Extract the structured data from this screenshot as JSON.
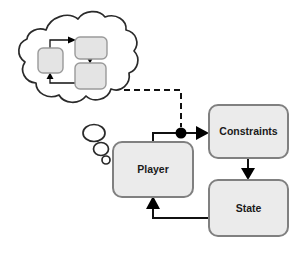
{
  "diagram": {
    "background_color": "#ffffff",
    "node_fill": "#ebebeb",
    "node_stroke": "#808080",
    "line_color": "#111111",
    "nodes": [
      {
        "id": "player",
        "label": "Player",
        "x": 113,
        "y": 142,
        "w": 80,
        "h": 55
      },
      {
        "id": "constraints",
        "label": "Constraints",
        "x": 209,
        "y": 105,
        "w": 79,
        "h": 53
      },
      {
        "id": "state",
        "label": "State",
        "x": 209,
        "y": 180,
        "w": 79,
        "h": 56
      }
    ],
    "mini_nodes": [
      {
        "id": "mini-left",
        "x": 38,
        "y": 48,
        "w": 25,
        "h": 25
      },
      {
        "id": "mini-top-right",
        "x": 75,
        "y": 37,
        "w": 32,
        "h": 22
      },
      {
        "id": "mini-bottom-right",
        "x": 75,
        "y": 63,
        "w": 31,
        "h": 26
      }
    ],
    "edges": [
      {
        "id": "player-to-constraints",
        "from": "player",
        "to": "constraints",
        "style": "solid"
      },
      {
        "id": "constraints-to-state",
        "from": "constraints",
        "to": "state",
        "style": "solid"
      },
      {
        "id": "state-to-player",
        "from": "state",
        "to": "player",
        "style": "solid"
      },
      {
        "id": "thought-to-junction",
        "from": "thought-cloud",
        "to": "player-to-constraints",
        "style": "dashed"
      }
    ],
    "mini_edges": [
      {
        "id": "mini-left-to-top",
        "from": "mini-left",
        "to": "mini-top-right",
        "style": "solid"
      },
      {
        "id": "mini-top-to-bottom",
        "from": "mini-top-right",
        "to": "mini-bottom-right",
        "style": "solid"
      },
      {
        "id": "mini-bottom-to-left",
        "from": "mini-bottom-right",
        "to": "mini-left",
        "style": "solid"
      }
    ],
    "thought_bubbles": [
      {
        "id": "bubble-large",
        "cx": 94,
        "cy": 133,
        "rx": 11,
        "ry": 8.5
      },
      {
        "id": "bubble-medium",
        "cx": 101,
        "cy": 149,
        "rx": 7.5,
        "ry": 6.5
      },
      {
        "id": "bubble-small",
        "cx": 106,
        "cy": 160,
        "rx": 4,
        "ry": 4
      }
    ],
    "junction": {
      "id": "signal-junction",
      "cx": 181,
      "cy": 133,
      "r": 5.5
    }
  }
}
